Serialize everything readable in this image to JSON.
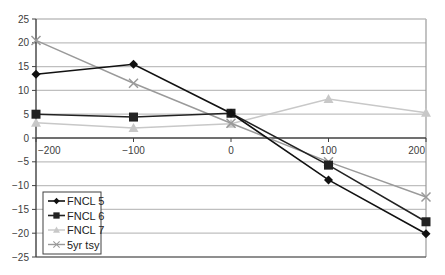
{
  "chart_data": {
    "type": "line",
    "title": "",
    "xlabel": "",
    "ylabel": "",
    "x": [
      -200,
      -100,
      0,
      100,
      200
    ],
    "xlim": [
      -200,
      200
    ],
    "ylim": [
      -25,
      25
    ],
    "xticks": [
      -200,
      -100,
      0,
      100,
      200
    ],
    "yticks": [
      25,
      20,
      15,
      10,
      5,
      0,
      -5,
      -10,
      -15,
      -20,
      -25
    ],
    "grid": "horizontal",
    "legend_position": "lower-left-inside",
    "series": [
      {
        "name": "FNCL 5",
        "values": [
          13.4,
          15.5,
          5.2,
          -8.8,
          -20.1
        ],
        "color": "#111111",
        "marker": "diamond",
        "width": 1.6
      },
      {
        "name": "FNCL 6",
        "values": [
          5.0,
          4.4,
          5.2,
          -5.7,
          -17.6
        ],
        "color": "#222222",
        "marker": "square",
        "width": 1.6
      },
      {
        "name": "FNCL 7",
        "values": [
          3.2,
          2.1,
          3.0,
          8.2,
          5.3
        ],
        "color": "#c8c8c8",
        "marker": "triangle",
        "width": 1.4
      },
      {
        "name": "5yr tsy",
        "values": [
          20.5,
          11.5,
          3.1,
          -5.0,
          -12.4
        ],
        "color": "#9a9a9a",
        "marker": "x",
        "width": 1.4
      }
    ]
  },
  "colors": {
    "gridline": "#bfbfbf",
    "axis": "#404040",
    "frame": "#9a9a9a"
  }
}
